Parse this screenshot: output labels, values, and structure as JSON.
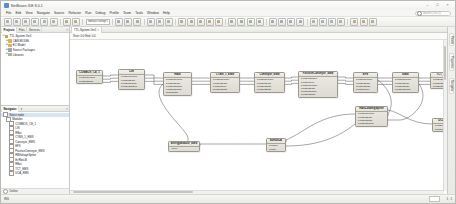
{
  "window": {
    "title": "NetBeans IDE 8.0.1",
    "app_icon": "netbeans-icon",
    "minimize": "–",
    "maximize": "□",
    "close": "×"
  },
  "menu": {
    "items": [
      {
        "label": "File"
      },
      {
        "label": "Edit"
      },
      {
        "label": "View"
      },
      {
        "label": "Navigate"
      },
      {
        "label": "Source"
      },
      {
        "label": "Refactor"
      },
      {
        "label": "Run"
      },
      {
        "label": "Debug"
      },
      {
        "label": "Profile"
      },
      {
        "label": "Team"
      },
      {
        "label": "Tools"
      },
      {
        "label": "Window"
      },
      {
        "label": "Help"
      }
    ],
    "search_placeholder": "Search (Ctrl+I)",
    "search_icon": "magnifier-icon"
  },
  "toolbar": {
    "config_value": "<default config>",
    "config_caret": "▾",
    "buttons": [
      {
        "name": "new-file-button",
        "icon": "new-file-icon"
      },
      {
        "name": "new-project-button",
        "icon": "new-project-icon"
      },
      {
        "name": "open-project-button",
        "icon": "open-project-icon"
      },
      {
        "name": "save-all-button",
        "icon": "save-all-icon"
      },
      {
        "name": "undo-button",
        "icon": "undo-icon"
      },
      {
        "name": "redo-button",
        "icon": "redo-icon"
      },
      {
        "name": "build-project-button",
        "icon": "hammer-icon"
      },
      {
        "name": "clean-build-button",
        "icon": "broom-icon"
      },
      {
        "name": "run-project-button",
        "icon": "play-icon"
      },
      {
        "name": "debug-project-button",
        "icon": "debug-icon"
      },
      {
        "name": "profile-project-button",
        "icon": "profile-icon"
      },
      {
        "name": "step-over-button",
        "icon": "step-over-icon"
      },
      {
        "name": "step-into-button",
        "icon": "step-into-icon"
      },
      {
        "name": "step-out-button",
        "icon": "step-out-icon"
      },
      {
        "name": "continue-button",
        "icon": "continue-icon"
      },
      {
        "name": "pause-button",
        "icon": "pause-icon"
      },
      {
        "name": "stop-button",
        "icon": "stop-icon"
      },
      {
        "name": "generate-code-button",
        "icon": "generate-icon"
      },
      {
        "name": "zoom-in-button",
        "icon": "zoom-in-icon"
      },
      {
        "name": "zoom-out-button",
        "icon": "zoom-out-icon"
      },
      {
        "name": "fit-diagram-button",
        "icon": "fit-icon"
      },
      {
        "name": "select-tool-button",
        "icon": "pointer-icon"
      },
      {
        "name": "connect-tool-button",
        "icon": "connect-icon"
      },
      {
        "name": "align-left-button",
        "icon": "align-left-icon"
      },
      {
        "name": "align-center-button",
        "icon": "align-center-icon"
      },
      {
        "name": "align-right-button",
        "icon": "align-right-icon"
      },
      {
        "name": "layout-button",
        "icon": "layout-icon"
      },
      {
        "name": "validate-button",
        "icon": "validate-icon"
      },
      {
        "name": "export-button",
        "icon": "export-icon"
      },
      {
        "name": "settings-button",
        "icon": "gear-icon"
      },
      {
        "name": "help-button",
        "icon": "help-icon"
      },
      {
        "name": "refresh-button",
        "icon": "refresh-icon"
      }
    ]
  },
  "projects_panel": {
    "tabs": [
      {
        "label": "Projects",
        "active": true,
        "name": "tab-projects"
      },
      {
        "label": "Files",
        "active": false,
        "name": "tab-files"
      },
      {
        "label": "Services",
        "active": false,
        "name": "tab-services"
      }
    ],
    "close_icon": "×",
    "tree": [
      {
        "indent": 0,
        "twisty": "⊖",
        "icon": "project-icon",
        "color": "#c8a24a",
        "label": "TTL-System-Ver1"
      },
      {
        "indent": 1,
        "twisty": "⊕",
        "icon": "folder-icon",
        "color": "#dcb35a",
        "label": "CAN MODEL"
      },
      {
        "indent": 1,
        "twisty": "⊕",
        "icon": "folder-icon",
        "color": "#dcb35a",
        "label": "EC Model"
      },
      {
        "indent": 1,
        "twisty": "⊕",
        "icon": "package-icon",
        "color": "#9aa7b5",
        "label": "Source Packages"
      },
      {
        "indent": 1,
        "twisty": "⊕",
        "icon": "library-icon",
        "color": "#a9b58f",
        "label": "Libraries"
      }
    ]
  },
  "navigator_panel": {
    "title": "Navigator",
    "caret": "▾",
    "close_icon": "×",
    "root_label": "Select node",
    "group_label": "Modules",
    "items": [
      {
        "label": "COMBOX_CE_1"
      },
      {
        "label": "LIN"
      },
      {
        "label": "RBat"
      },
      {
        "label": "CYBS_1_EMS"
      },
      {
        "label": "Conveyor_EMS"
      },
      {
        "label": "EFS"
      },
      {
        "label": "PositiveConveyor_EMS"
      },
      {
        "label": "RBVoltageSpline"
      },
      {
        "label": "EcRbxLB"
      },
      {
        "label": "RBat"
      },
      {
        "label": "TCT_EMS"
      },
      {
        "label": "DCA_EMS"
      }
    ],
    "footer_label": "Outline",
    "footer_icon": "outline-icon"
  },
  "editor": {
    "tab_label": "TTL-System-Ver1",
    "tab_close": "×",
    "breadcrumb": "Start: 0.0  End: 0.0"
  },
  "right_rail": {
    "tabs": [
      {
        "label": "Palette"
      },
      {
        "label": "Properties"
      },
      {
        "label": "Navigator"
      }
    ]
  },
  "status_bar": {
    "message": "INS",
    "position": "1 : 1",
    "progress_label": ""
  },
  "diagram": {
    "blocks": [
      {
        "id": "combox",
        "name": "COMBOX_CE_1",
        "x": 6,
        "y": 30,
        "w": 27,
        "h": 16,
        "ports_out": [
          "PortOutParam",
          "PortOutData"
        ],
        "ports_in": []
      },
      {
        "id": "lin",
        "name": "LIN",
        "x": 48,
        "y": 29,
        "w": 27,
        "h": 21,
        "ports_out": [
          "PortOutParam",
          "PortOutData",
          "PortOutSignal",
          "PortOutStatus"
        ],
        "ports_in": []
      },
      {
        "id": "rbat1",
        "name": "RBat",
        "x": 93,
        "y": 32,
        "w": 29,
        "h": 25,
        "ports_out": [
          "PortOutParam",
          "PortOutData",
          "PortOutStatus",
          "PortOutSignal",
          "setupState"
        ],
        "ports_in": []
      },
      {
        "id": "cybs",
        "name": "CYBS_1_EMS",
        "x": 140,
        "y": 32,
        "w": 30,
        "h": 21,
        "ports_out": [
          "PortOutParam",
          "PortOutData",
          "PortOutLine",
          "PortOutState"
        ],
        "ports_in": []
      },
      {
        "id": "conveyor",
        "name": "Conveyor_EMS",
        "x": 184,
        "y": 32,
        "w": 31,
        "h": 20,
        "ports_out": [
          "PortOutParam",
          "PortOutData",
          "PortOutState",
          "PortOutData"
        ],
        "ports_in": []
      },
      {
        "id": "posconv",
        "name": "PositiveConveyor_EMS",
        "x": 228,
        "y": 31,
        "w": 40,
        "h": 25,
        "ports_out": [
          "PortOutStatus",
          "PortOutLine",
          "PortOutParam",
          "PortOutData",
          "PortOutSignal",
          "PortOutState"
        ],
        "ports_in": []
      },
      {
        "id": "efs",
        "name": "EFS",
        "x": 283,
        "y": 32,
        "w": 25,
        "h": 20,
        "ports_out": [
          "PortOutParam",
          "PortOutData",
          "PortOutState",
          "PortOutLine"
        ],
        "ports_in": []
      },
      {
        "id": "ebat",
        "name": "EBat",
        "x": 322,
        "y": 32,
        "w": 27,
        "h": 21,
        "ports_out": [
          "PortOutParam",
          "PortOutData",
          "PortOutState",
          "PortOutSignal"
        ],
        "ports_in": []
      },
      {
        "id": "tct",
        "name": "TCT_EMS",
        "x": 360,
        "y": 32,
        "w": 26,
        "h": 20,
        "ports_out": [
          "PortOutParam",
          "PortOutData",
          "PortOutState"
        ],
        "ports_in": []
      },
      {
        "id": "rbvolt",
        "name": "RBxLoadingSpline",
        "x": 285,
        "y": 66,
        "w": 33,
        "h": 22,
        "ports_out": [
          "PortOutParam",
          "PortOutData",
          "PortOutState",
          "PortOutSignal"
        ],
        "ports_in": []
      },
      {
        "id": "dca",
        "name": "DCA_EMS",
        "x": 362,
        "y": 78,
        "w": 26,
        "h": 14,
        "ports_out": [
          "PortOutData",
          "PortOutState"
        ],
        "ports_in": []
      },
      {
        "id": "energy",
        "name": "EnergyModule_EMS",
        "x": 98,
        "y": 101,
        "w": 32,
        "h": 11,
        "ports_out": [
          "Value"
        ],
        "ports_in": []
      },
      {
        "id": "ecrbx",
        "name": "EcRbxLB",
        "x": 196,
        "y": 98,
        "w": 20,
        "h": 15,
        "ports_out": [
          "PortOut",
          "PortIn"
        ],
        "ports_in": []
      }
    ]
  }
}
